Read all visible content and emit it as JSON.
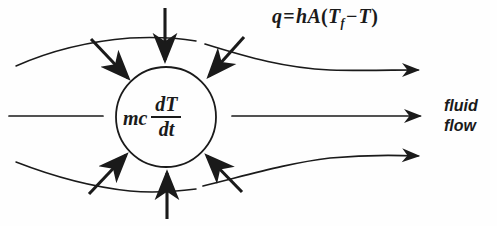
{
  "figure": {
    "width": 497,
    "height": 226,
    "background_color": "#fefefe",
    "ink_color": "#1a1a1a"
  },
  "equations": {
    "heat_rate": {
      "name": "convective-heat-rate",
      "q": "q",
      "equals": "=",
      "h": "h",
      "A": "A",
      "paren_open": "(",
      "T_f": "T",
      "subscript_f": "f",
      "minus": "−",
      "T": "T",
      "paren_close": ")",
      "plain_text": "q = hA(Tf − T)"
    },
    "capacitance": {
      "name": "thermal-capacitance-term",
      "mc": "mc",
      "numerator": "dT",
      "denominator": "dt",
      "plain_text": "mc dT/dt"
    }
  },
  "labels": {
    "fluid_flow_line1": "fluid",
    "fluid_flow_line2": "flow"
  },
  "diagram_elements": {
    "body": {
      "name": "control-volume-circle",
      "shape": "circle",
      "center_x": 166,
      "center_y": 117,
      "radius": 50
    },
    "streamlines": [
      {
        "name": "upper-streamline",
        "has_arrowhead": true,
        "direction": "left-to-right"
      },
      {
        "name": "center-streamline",
        "has_arrowhead": true,
        "direction": "left-to-right"
      },
      {
        "name": "lower-streamline",
        "has_arrowhead": true,
        "direction": "left-to-right"
      }
    ],
    "heat_flux_arrows": [
      {
        "name": "heat-arrow-top",
        "points": "inward",
        "angle_deg": 90
      },
      {
        "name": "heat-arrow-top-left",
        "points": "inward",
        "angle_deg": 135
      },
      {
        "name": "heat-arrow-top-right",
        "points": "inward",
        "angle_deg": 45
      },
      {
        "name": "heat-arrow-bottom",
        "points": "inward",
        "angle_deg": 270
      },
      {
        "name": "heat-arrow-bottom-left",
        "points": "inward",
        "angle_deg": 225
      },
      {
        "name": "heat-arrow-bottom-right",
        "points": "inward",
        "angle_deg": 315
      }
    ]
  }
}
